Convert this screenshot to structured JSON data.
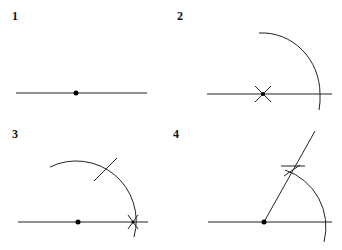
{
  "panels": [
    {
      "label": "1",
      "step": "line with point"
    },
    {
      "label": "2",
      "step": "arc drawn from point"
    },
    {
      "label": "3",
      "step": "arc intersection marked"
    },
    {
      "label": "4",
      "step": "60 degree ray constructed"
    }
  ],
  "colors": {
    "stroke": "#222222",
    "background": "#ffffff"
  }
}
